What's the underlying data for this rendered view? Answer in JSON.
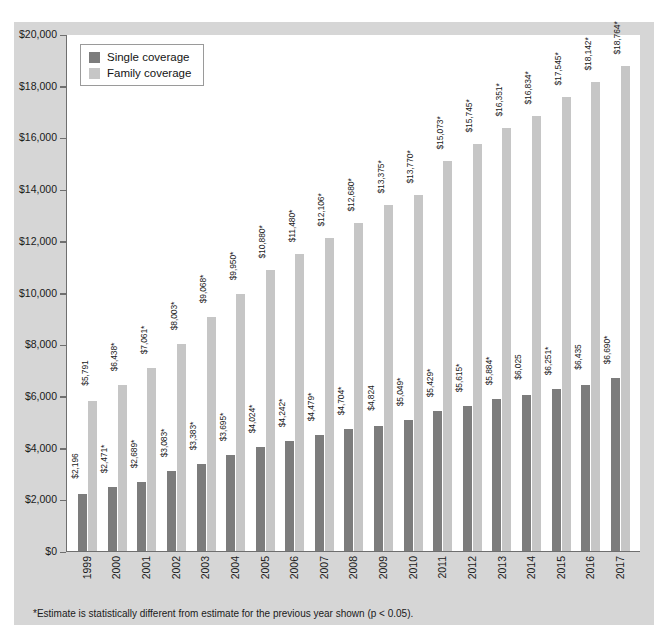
{
  "chart_data": {
    "type": "bar",
    "title": "",
    "xlabel": "",
    "ylabel": "",
    "ylim": [
      0,
      20000
    ],
    "grid": false,
    "legend_position": "top-left",
    "categories": [
      "1999",
      "2000",
      "2001",
      "2002",
      "2003",
      "2004",
      "2005",
      "2006",
      "2007",
      "2008",
      "2009",
      "2010",
      "2011",
      "2012",
      "2013",
      "2014",
      "2015",
      "2016",
      "2017"
    ],
    "series": [
      {
        "name": "Single coverage",
        "color": "#7c7c7c",
        "values": [
          2196,
          2471,
          2689,
          3083,
          3383,
          3695,
          4024,
          4242,
          4479,
          4704,
          4824,
          5049,
          5429,
          5615,
          5884,
          6025,
          6251,
          6435,
          6690
        ],
        "labels": [
          "$2,196",
          "$2,471*",
          "$2,689*",
          "$3,083*",
          "$3,383*",
          "$3,695*",
          "$4,024*",
          "$4,242*",
          "$4,479*",
          "$4,704*",
          "$4,824",
          "$5,049*",
          "$5,429*",
          "$5,615*",
          "$5,884*",
          "$6,025",
          "$6,251*",
          "$6,435",
          "$6,690*"
        ]
      },
      {
        "name": "Family coverage",
        "color": "#c6c6c6",
        "values": [
          5791,
          6438,
          7061,
          8003,
          9068,
          9950,
          10880,
          11480,
          12106,
          12680,
          13375,
          13770,
          15073,
          15745,
          16351,
          16834,
          17545,
          18142,
          18764
        ],
        "labels": [
          "$5,791",
          "$6,438*",
          "$7,061*",
          "$8,003*",
          "$9,068*",
          "$9,950*",
          "$10,880*",
          "$11,480*",
          "$12,106*",
          "$12,680*",
          "$13,375*",
          "$13,770*",
          "$15,073*",
          "$15,745*",
          "$16,351*",
          "$16,834*",
          "$17,545*",
          "$18,142*",
          "$18,764*"
        ]
      }
    ],
    "yticks": [
      0,
      2000,
      4000,
      6000,
      8000,
      10000,
      12000,
      14000,
      16000,
      18000,
      20000
    ],
    "ytick_labels": [
      "$0",
      "$2,000",
      "$4,000",
      "$6,000",
      "$8,000",
      "$10,000",
      "$12,000",
      "$14,000",
      "$16,000",
      "$18,000",
      "$20,000"
    ]
  },
  "legend": {
    "items": [
      {
        "label": "Single coverage",
        "key": "single"
      },
      {
        "label": "Family coverage",
        "key": "family"
      }
    ]
  },
  "footnote": {
    "text": "*Estimate is statistically different from estimate for the previous year shown (p < 0.05)."
  },
  "colors": {
    "single": "#7c7c7c",
    "family": "#c6c6c6",
    "panel_background": "#d6d6d6",
    "plot_background": "#ffffff",
    "axis": "#6f6f6f",
    "text": "#1a1a1a"
  }
}
